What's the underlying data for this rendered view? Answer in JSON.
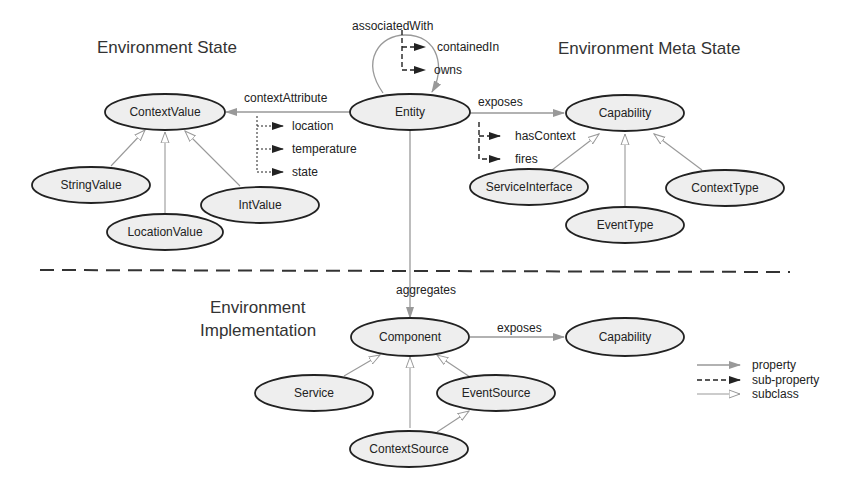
{
  "sections": {
    "env_state": "Environment State",
    "env_meta_state": "Environment Meta State",
    "env_impl_line1": "Environment",
    "env_impl_line2": "Implementation"
  },
  "nodes": {
    "context_value": "ContextValue",
    "entity": "Entity",
    "capability": "Capability",
    "string_value": "StringValue",
    "int_value": "IntValue",
    "location_value": "LocationValue",
    "service_interface": "ServiceInterface",
    "event_type": "EventType",
    "context_type": "ContextType",
    "component": "Component",
    "capability2": "Capability",
    "service": "Service",
    "event_source": "EventSource",
    "context_source": "ContextSource"
  },
  "edges": {
    "associated_with": "associatedWith",
    "contained_in": "containedIn",
    "owns": "owns",
    "context_attribute": "contextAttribute",
    "location": "location",
    "temperature": "temperature",
    "state": "state",
    "exposes": "exposes",
    "has_context": "hasContext",
    "fires": "fires",
    "aggregates": "aggregates",
    "exposes2": "exposes"
  },
  "legend": {
    "property": "property",
    "sub_property": "sub-property",
    "subclass": "subclass"
  },
  "colors": {
    "node_fill": "#eeeeee",
    "node_stroke": "#222222",
    "property_arrow": "#999999",
    "subproperty_arrow": "#222222"
  }
}
